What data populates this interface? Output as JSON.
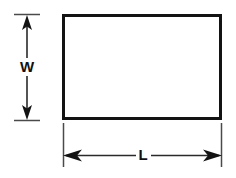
{
  "diagram": {
    "type": "engineering-dimension-drawing",
    "background_color": "#ffffff",
    "line_color": "#131313",
    "shape": {
      "name": "rectangle",
      "x": 62,
      "y": 14,
      "width": 160,
      "height": 106,
      "stroke_width": 3,
      "fill": "#ffffff"
    },
    "dimensions": [
      {
        "id": "width",
        "label": "W",
        "orientation": "vertical",
        "position": "left",
        "line_x": 27,
        "line_start": 14,
        "line_end": 120,
        "label_center": 67,
        "extension_start": 14,
        "extension_end": 40,
        "arrow_start": "up",
        "arrow_end": "down"
      },
      {
        "id": "length",
        "label": "L",
        "orientation": "horizontal",
        "position": "bottom",
        "line_y": 155,
        "line_start": 63,
        "line_end": 222,
        "label_center": 143,
        "extension_start": 123,
        "extension_end": 167,
        "arrow_start": "left",
        "arrow_end": "right"
      }
    ]
  }
}
